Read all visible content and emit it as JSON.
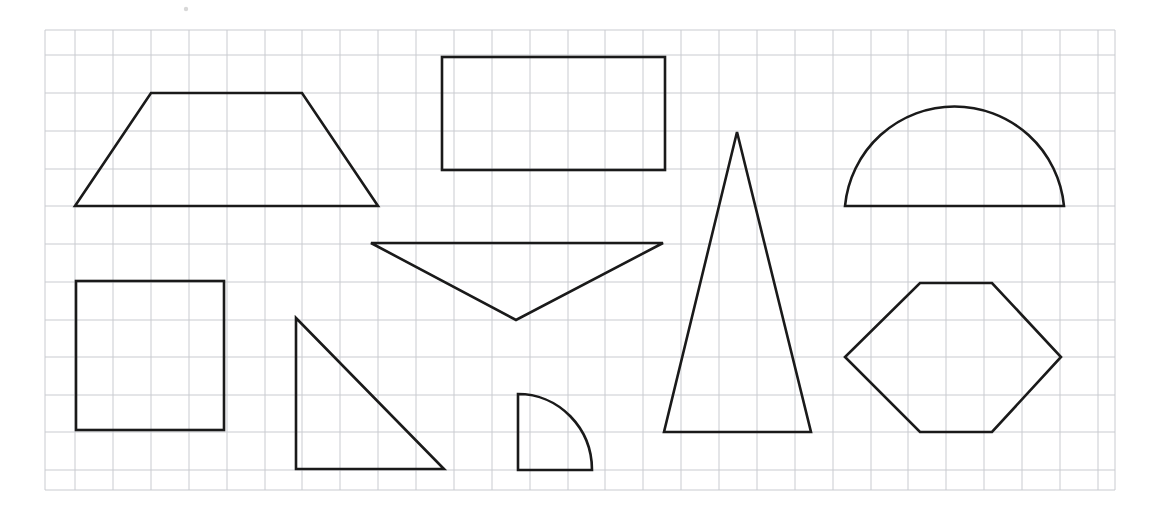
{
  "page": {
    "width": 1157,
    "height": 518,
    "background_color": "#ffffff"
  },
  "grid": {
    "label": "graph-paper-grid",
    "line_color": "#c9cbd0",
    "line_width": 1,
    "cell_size": 37.8,
    "x_start": 45,
    "x_end": 1115,
    "y_start": 30,
    "y_end": 490,
    "vertical_lines_x": [
      45,
      75,
      113,
      151,
      189,
      227,
      265,
      302,
      340,
      378,
      416,
      454,
      492,
      530,
      568,
      605,
      643,
      681,
      719,
      757,
      795,
      833,
      871,
      908,
      946,
      984,
      1022,
      1060,
      1098,
      1115
    ],
    "horizontal_lines_y": [
      30,
      55,
      93,
      131,
      169,
      206,
      244,
      282,
      320,
      357,
      395,
      432,
      470,
      490
    ]
  },
  "ink": {
    "stroke_color": "#1a1a1a",
    "stroke_width": 2.6,
    "fill": "none"
  },
  "shapes": [
    {
      "id": "trapezoid",
      "name": "trapezoid",
      "type": "polygon",
      "points": "75,206 151,93 302,93 378,206",
      "row": "top",
      "column": 1
    },
    {
      "id": "rectangle",
      "name": "rectangle",
      "type": "rect",
      "x": 442,
      "y": 57,
      "width": 223,
      "height": 113,
      "row": "top",
      "column": 2
    },
    {
      "id": "tall-triangle",
      "name": "tall-isosceles-triangle",
      "type": "polygon",
      "points": "737,132 811,432 664,432",
      "row": "full",
      "column": 3
    },
    {
      "id": "semicircle",
      "name": "semicircle",
      "type": "path",
      "d": "M 845,206 A 110,110 0 0 1 1064,206 Z",
      "row": "top",
      "column": 4
    },
    {
      "id": "inverted-triangle",
      "name": "inverted-triangle",
      "type": "polygon",
      "points": "371,243 663,243 516,320",
      "row": "middle",
      "column": 2
    },
    {
      "id": "square",
      "name": "square",
      "type": "rect",
      "x": 76,
      "y": 281,
      "width": 148,
      "height": 149,
      "row": "bottom",
      "column": 1
    },
    {
      "id": "right-triangle",
      "name": "right-triangle",
      "type": "polygon",
      "points": "296,318 296,469 444,469",
      "row": "bottom",
      "column": 2
    },
    {
      "id": "quarter-circle",
      "name": "quarter-circle",
      "type": "path",
      "d": "M 518,394 L 518,470 L 592,470 A 74,76 0 0 0 518,394 Z",
      "row": "bottom",
      "column": 2
    },
    {
      "id": "hexagon",
      "name": "hexagon",
      "type": "polygon",
      "points": "920,283 992,283 1061,357 992,432 920,432 845,357",
      "row": "bottom",
      "column": 4
    }
  ],
  "marks": [
    {
      "id": "speck-top",
      "name": "paper-speck",
      "cx": 186,
      "cy": 9,
      "r": 2.2,
      "color": "#d8d8d8"
    }
  ]
}
